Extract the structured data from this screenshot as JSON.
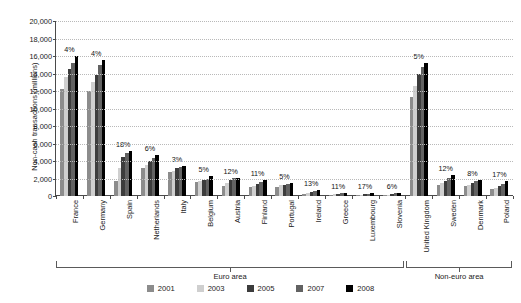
{
  "chart_data": {
    "type": "bar",
    "title": "",
    "xlabel": "",
    "ylabel": "Non-cash transactions (millions)",
    "ylim": [
      0,
      20000
    ],
    "ytick_values": [
      20000,
      18000,
      16000,
      14000,
      12000,
      10000,
      8000,
      6000,
      4000,
      2000,
      0
    ],
    "ytick_labels": [
      "20,000",
      "18,000",
      "16,000",
      "14,000",
      "12,000",
      "10,000",
      "8,000",
      "6,000",
      "4,000",
      "2,000",
      "0"
    ],
    "grid": true,
    "legend_position": "bottom",
    "categories": [
      "France",
      "Germany",
      "Spain",
      "Netherlands",
      "Italy",
      "Belgium",
      "Austria",
      "Finland",
      "Portugal",
      "Ireland",
      "Greece",
      "Luxembourg",
      "Slovenia",
      "United Kingdom",
      "Sweden",
      "Denmark",
      "Poland"
    ],
    "series": [
      {
        "name": "2001",
        "color": "#8c8c8c",
        "values": [
          12200,
          12000,
          1750,
          3150,
          2750,
          1600,
          1100,
          1000,
          1050,
          250,
          150,
          110,
          120,
          11300,
          1250,
          1150,
          750
        ]
      },
      {
        "name": "2003",
        "color": "#cfcfcf",
        "values": [
          13600,
          13000,
          3250,
          3550,
          2900,
          1700,
          1500,
          1150,
          1250,
          300,
          210,
          150,
          160,
          12600,
          1450,
          1300,
          900
        ]
      },
      {
        "name": "2005",
        "color": "#3c3c3c",
        "values": [
          14500,
          13850,
          4450,
          3950,
          3200,
          1800,
          1850,
          1350,
          1300,
          450,
          270,
          200,
          230,
          13900,
          1700,
          1500,
          1150
        ]
      },
      {
        "name": "2007",
        "color": "#626262",
        "values": [
          15200,
          15000,
          4900,
          4300,
          3350,
          1950,
          2050,
          1600,
          1400,
          600,
          330,
          260,
          290,
          14700,
          2050,
          1700,
          1400
        ]
      },
      {
        "name": "2008",
        "color": "#000000",
        "values": [
          16000,
          15500,
          5150,
          4650,
          3400,
          2250,
          2100,
          1800,
          1500,
          700,
          380,
          300,
          380,
          15250,
          2400,
          1850,
          1700
        ]
      }
    ],
    "annotations": [
      {
        "category": "France",
        "label": "4%"
      },
      {
        "category": "Germany",
        "label": "4%"
      },
      {
        "category": "Spain",
        "label": "18%"
      },
      {
        "category": "Netherlands",
        "label": "6%"
      },
      {
        "category": "Italy",
        "label": "3%"
      },
      {
        "category": "Belgium",
        "label": "5%"
      },
      {
        "category": "Austria",
        "label": "12%"
      },
      {
        "category": "Finland",
        "label": "11%"
      },
      {
        "category": "Portugal",
        "label": "5%"
      },
      {
        "category": "Ireland",
        "label": "13%"
      },
      {
        "category": "Greece",
        "label": "11%"
      },
      {
        "category": "Luxembourg",
        "label": "17%"
      },
      {
        "category": "Slovenia",
        "label": "6%"
      },
      {
        "category": "United Kingdom",
        "label": "5%"
      },
      {
        "category": "Sweden",
        "label": "12%"
      },
      {
        "category": "Denmark",
        "label": "8%"
      },
      {
        "category": "Poland",
        "label": "17%"
      }
    ],
    "group_brackets": [
      {
        "label": "Euro area",
        "start": 0,
        "end": 12
      },
      {
        "label": "Non-euro area",
        "start": 13,
        "end": 16
      }
    ]
  },
  "legend": {
    "items": [
      {
        "label": "2001",
        "color": "#8c8c8c"
      },
      {
        "label": "2003",
        "color": "#cfcfcf"
      },
      {
        "label": "2005",
        "color": "#3c3c3c"
      },
      {
        "label": "2007",
        "color": "#626262"
      },
      {
        "label": "2008",
        "color": "#000000"
      }
    ]
  }
}
